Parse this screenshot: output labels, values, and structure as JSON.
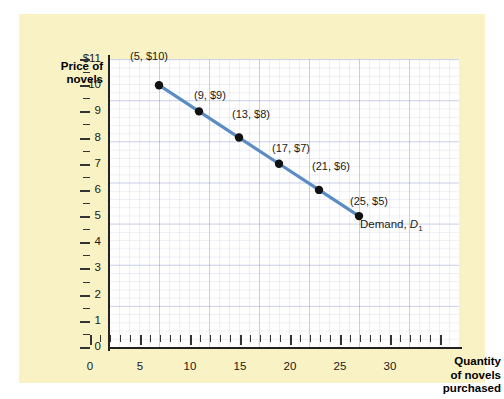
{
  "axes": {
    "y_title": "Price of novels",
    "x_title_lines": [
      "Quantity",
      "of novels",
      "purchased"
    ],
    "y_ticks": [
      "$11",
      "10",
      "9",
      "8",
      "7",
      "6",
      "5",
      "4",
      "3",
      "2",
      "1",
      "0"
    ],
    "x_ticks": [
      "0",
      "5",
      "10",
      "15",
      "20",
      "25",
      "30"
    ]
  },
  "curve": {
    "label_prefix": "Demand, ",
    "label_symbol": "D",
    "label_sub": "1",
    "color": "#5b8cc4"
  },
  "chart_data": {
    "type": "line",
    "title": "",
    "subtitle": "",
    "xlabel": "Quantity of novels purchased",
    "ylabel": "Price of novels",
    "xlim": [
      0,
      35
    ],
    "ylim": [
      0,
      11
    ],
    "xticks": [
      0,
      5,
      10,
      15,
      20,
      25,
      30
    ],
    "yticks": [
      0,
      1,
      2,
      3,
      4,
      5,
      6,
      7,
      8,
      9,
      10,
      11
    ],
    "grid": true,
    "legend": "none",
    "series": [
      {
        "name": "Demand, D1",
        "color": "#5b8cc4",
        "marker": "filled-circle",
        "x": [
          5,
          9,
          13,
          17,
          21,
          25
        ],
        "y": [
          10,
          9,
          8,
          7,
          6,
          5
        ],
        "point_labels": [
          "(5, $10)",
          "(9, $9)",
          "(13, $8)",
          "(17, $7)",
          "(21, $6)",
          "(25, $5)"
        ]
      }
    ],
    "annotations": [
      {
        "text": "Demand, D1",
        "x": 26,
        "y": 4.2
      }
    ]
  }
}
